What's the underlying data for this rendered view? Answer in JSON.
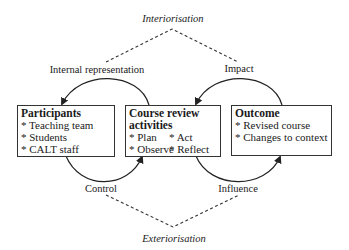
{
  "diagram": {
    "top_label": "Interiorisation",
    "bottom_label": "Exteriorisation",
    "arc_labels": {
      "top_left": "Internal representation",
      "top_right": "Impact",
      "bottom_left": "Control",
      "bottom_right": "Influence"
    },
    "boxes": [
      {
        "title": "Participants",
        "items": [
          "* Teaching team",
          "* Students",
          "* CALT staff"
        ]
      },
      {
        "title": "Course review activities",
        "title_line1": "Course review",
        "title_line2": "activities",
        "items": [
          "* Plan",
          "* Act",
          "* Observe",
          "* Reflect"
        ]
      },
      {
        "title": "Outcome",
        "items": [
          "* Revised course",
          "* Changes to context"
        ]
      }
    ],
    "colors": {
      "line": "#222222",
      "box_border": "#333333",
      "background": "#ffffff"
    }
  }
}
